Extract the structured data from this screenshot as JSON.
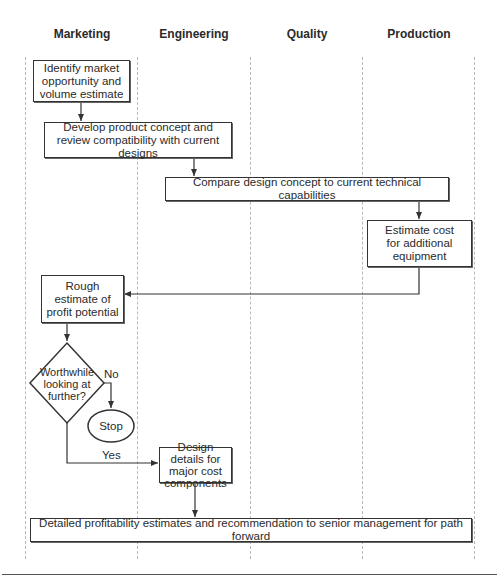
{
  "lanes": [
    {
      "label": "Marketing"
    },
    {
      "label": "Engineering"
    },
    {
      "label": "Quality"
    },
    {
      "label": "Production"
    }
  ],
  "nodes": {
    "identify_market": "Identify market opportunity and volume estimate",
    "develop_concept": "Develop product concept and review compatibility with current designs",
    "compare_design": "Compare design concept to current technical capabilities",
    "estimate_cost": "Estimate cost for additional equipment",
    "rough_estimate": "Rough estimate of profit potential",
    "decision": "Worthwhile looking at further?",
    "stop": "Stop",
    "design_details": "Design details for major cost components",
    "detailed_estimates": "Detailed profitability estimates and recommendation to senior management for path forward"
  },
  "edge_labels": {
    "no": "No",
    "yes": "Yes"
  },
  "colors": {
    "line": "#333333",
    "divider": "#b8b8b8"
  }
}
